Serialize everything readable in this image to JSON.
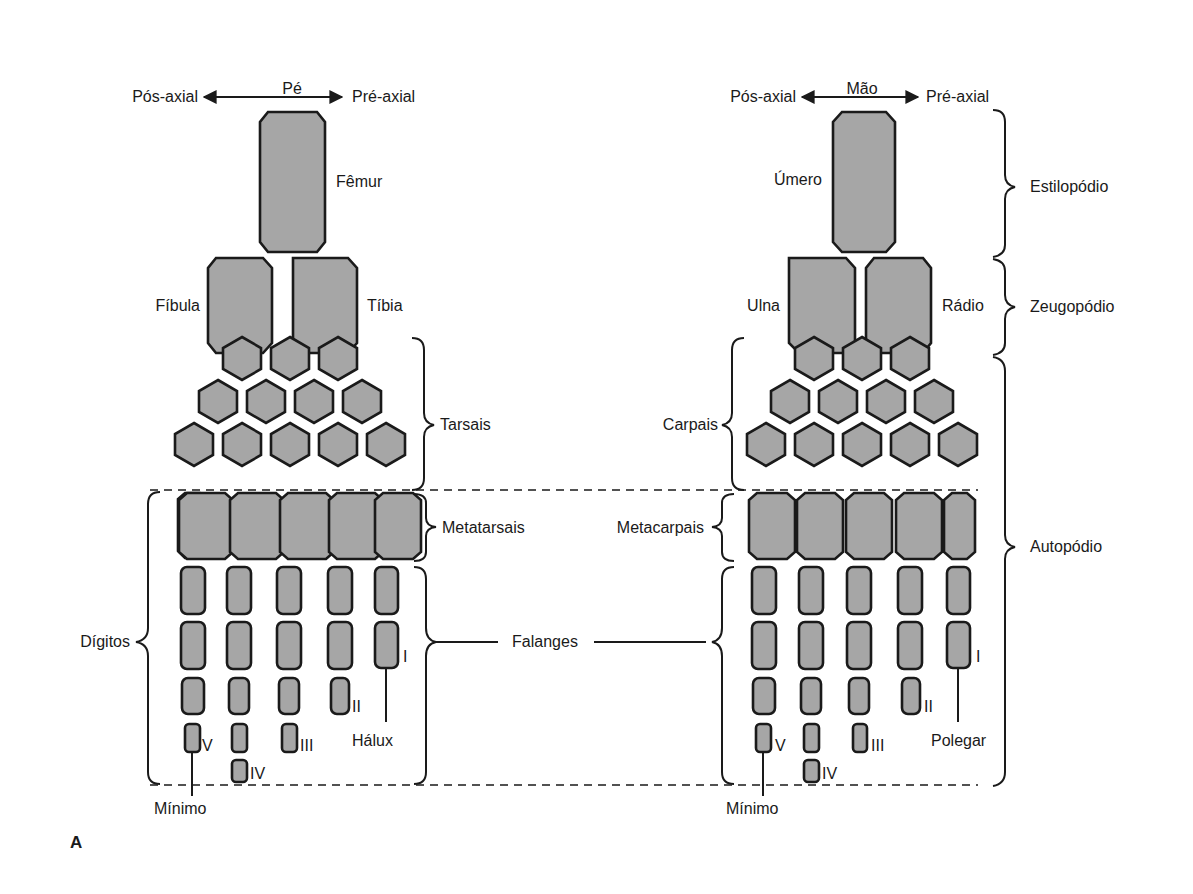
{
  "figure_label": "A",
  "foot": {
    "title": "Pé",
    "axis_left": "Pós-axial",
    "axis_right": "Pré-axial",
    "stylopod_label": "Fêmur",
    "zeugopod_left_label": "Fíbula",
    "zeugopod_right_label": "Tíbia",
    "mesopod_label": "Tarsais",
    "metapod_label": "Metatarsais",
    "digits_label": "Dígitos",
    "first_digit_label": "Hálux",
    "fifth_digit_label": "Mínimo",
    "digit_numerals": [
      "V",
      "IV",
      "III",
      "II",
      "I"
    ]
  },
  "hand": {
    "title": "Mão",
    "axis_left": "Pós-axial",
    "axis_right": "Pré-axial",
    "stylopod_label": "Úmero",
    "zeugopod_left_label": "Ulna",
    "zeugopod_right_label": "Rádio",
    "mesopod_label": "Carpais",
    "metapod_label": "Metacarpais",
    "first_digit_label": "Polegar",
    "fifth_digit_label": "Mínimo",
    "digit_numerals": [
      "V",
      "IV",
      "III",
      "II",
      "I"
    ]
  },
  "shared": {
    "phalanges_label": "Falanges"
  },
  "segments": {
    "stylopod": "Estilopódio",
    "zeugopod": "Zeugopódio",
    "autopod": "Autopódio"
  },
  "colors": {
    "bone_fill": "#a6a6a6",
    "outline": "#1a1a1a",
    "background": "#ffffff"
  }
}
